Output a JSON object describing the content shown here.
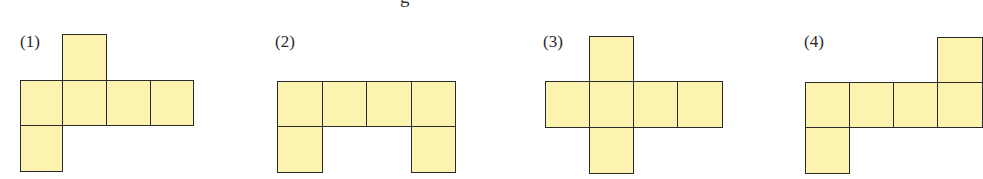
{
  "header_fragment": "g",
  "colors": {
    "fill": "#fdf3b0",
    "stroke": "#2a2a2a",
    "background": "#ffffff"
  },
  "nets": [
    {
      "label": "(1)",
      "cells": [
        [
          1,
          0
        ],
        [
          0,
          1
        ],
        [
          1,
          1
        ],
        [
          2,
          1
        ],
        [
          3,
          1
        ],
        [
          0,
          2
        ]
      ]
    },
    {
      "label": "(2)",
      "cells": [
        [
          0,
          1
        ],
        [
          1,
          1
        ],
        [
          2,
          1
        ],
        [
          3,
          1
        ],
        [
          0,
          2
        ],
        [
          3,
          2
        ]
      ]
    },
    {
      "label": "(3)",
      "cells": [
        [
          1,
          0
        ],
        [
          0,
          1
        ],
        [
          1,
          1
        ],
        [
          2,
          1
        ],
        [
          3,
          1
        ],
        [
          1,
          2
        ]
      ]
    },
    {
      "label": "(4)",
      "cells": [
        [
          3,
          0
        ],
        [
          0,
          1
        ],
        [
          1,
          1
        ],
        [
          2,
          1
        ],
        [
          3,
          1
        ],
        [
          0,
          2
        ]
      ]
    }
  ]
}
